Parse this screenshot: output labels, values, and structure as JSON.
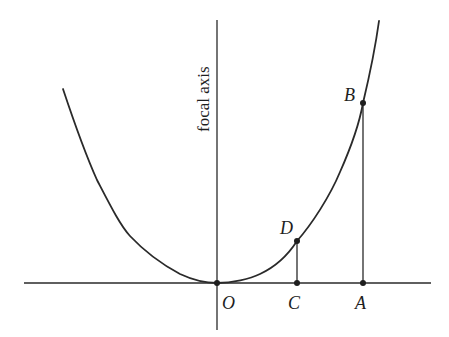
{
  "diagram": {
    "type": "parabola with focal axis",
    "axis_label": "focal axis",
    "points": [
      {
        "id": "O",
        "label": "O",
        "x": 217,
        "y": 283,
        "label_x": 222,
        "label_y": 309
      },
      {
        "id": "C",
        "label": "C",
        "x": 297,
        "y": 283,
        "label_x": 288,
        "label_y": 309
      },
      {
        "id": "A",
        "label": "A",
        "x": 363,
        "y": 283,
        "label_x": 355,
        "label_y": 309
      },
      {
        "id": "D",
        "label": "D",
        "x": 297,
        "y": 241,
        "label_x": 280,
        "label_y": 233
      },
      {
        "id": "B",
        "label": "B",
        "x": 363,
        "y": 103,
        "label_x": 344,
        "label_y": 101
      }
    ],
    "segments": [
      {
        "from": "C",
        "to": "D"
      },
      {
        "from": "A",
        "to": "B"
      }
    ],
    "colors": {
      "stroke": "#2a2a2a",
      "background": "#ffffff"
    }
  }
}
